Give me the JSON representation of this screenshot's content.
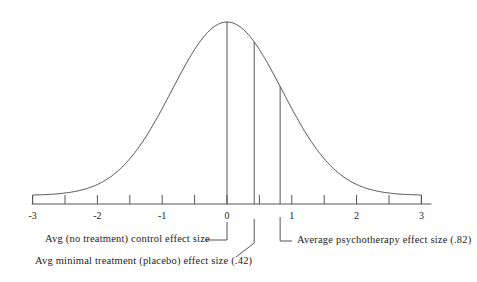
{
  "diagram": {
    "type": "normal_distribution",
    "x_axis": {
      "min": -3,
      "max": 3,
      "major_tick_labels": [
        "-3",
        "-2",
        "-1",
        "0",
        "1",
        "2",
        "3"
      ],
      "minor_tick_step": 0.5
    },
    "markers": [
      {
        "id": "control",
        "value": 0,
        "label": "Avg (no treatment) control effect size"
      },
      {
        "id": "placebo",
        "value": 0.42,
        "label": "Avg minimal treatment (placebo) effect size (.42)"
      },
      {
        "id": "psychotherapy",
        "value": 0.82,
        "label": "Average psychotherapy effect size (.82)"
      }
    ],
    "colors": {
      "line": "#555555",
      "text": "#222222",
      "background": "#ffffff"
    }
  }
}
